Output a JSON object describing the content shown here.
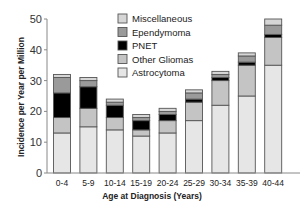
{
  "chart_data": {
    "type": "bar",
    "stacked": true,
    "title": "",
    "xlabel": "Age at Diagnosis (Years)",
    "ylabel": "Incidence per Year per Million",
    "ylim": [
      0,
      50
    ],
    "yticks": [
      0,
      10,
      20,
      30,
      40,
      50
    ],
    "grid": false,
    "legend_position": "top-right-inside",
    "categories": [
      "0-4",
      "5-9",
      "10-14",
      "15-19",
      "20-24",
      "25-29",
      "30-34",
      "35-39",
      "40-44"
    ],
    "series": [
      {
        "name": "Astrocytoma",
        "color": "#e6e6e6",
        "values": [
          13,
          15,
          14,
          12,
          13,
          17,
          22,
          25,
          35
        ]
      },
      {
        "name": "Other Gliomas",
        "color": "#c4c4c4",
        "values": [
          5,
          6,
          4,
          2,
          4,
          6,
          8,
          10,
          9
        ]
      },
      {
        "name": "PNET",
        "color": "#000000",
        "values": [
          8,
          7,
          4,
          3,
          2,
          1,
          1,
          1,
          1
        ]
      },
      {
        "name": "Ependymoma",
        "color": "#9a9a9a",
        "values": [
          5,
          2,
          1,
          1,
          1,
          2,
          1,
          2,
          3
        ]
      },
      {
        "name": "Miscellaneous",
        "color": "#d6d6d6",
        "values": [
          1,
          1,
          1,
          1,
          1,
          1,
          1,
          1,
          2
        ]
      }
    ],
    "totals": [
      32,
      31,
      24,
      19,
      21,
      27,
      33,
      39,
      50
    ]
  },
  "legend": {
    "items": [
      {
        "label": "Miscellaneous",
        "color": "#d6d6d6"
      },
      {
        "label": "Ependymoma",
        "color": "#9a9a9a"
      },
      {
        "label": "PNET",
        "color": "#000000"
      },
      {
        "label": "Other Gliomas",
        "color": "#c4c4c4"
      },
      {
        "label": "Astrocytoma",
        "color": "#e6e6e6"
      }
    ]
  }
}
